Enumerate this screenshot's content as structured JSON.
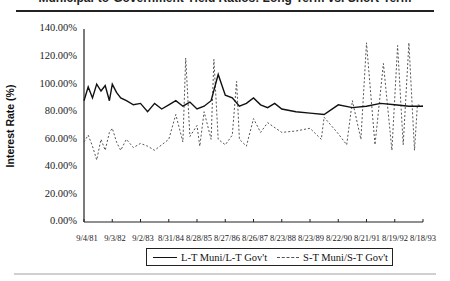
{
  "header": {
    "title_partial": "Municipal-to-Government Yield Ratios: Long-Term vs. Short-Term"
  },
  "chart_data": {
    "type": "line",
    "title": "",
    "xlabel": "",
    "ylabel": "Interest Rate (%)",
    "ylim": [
      0,
      140
    ],
    "yticks": [
      "0.00%",
      "20.00%",
      "40.00%",
      "60.00%",
      "80.00%",
      "100.00%",
      "120.00%",
      "140.00%"
    ],
    "xticks": [
      "9/4/81",
      "9/3/82",
      "9/2/83",
      "8/31/84",
      "8/28/85",
      "8/27/86",
      "8/26/87",
      "8/23/88",
      "8/23/89",
      "8/22/90",
      "8/21/91",
      "8/19/92",
      "8/18/93"
    ],
    "grid": false,
    "legend_position": "bottom",
    "series": [
      {
        "name": "L-T Muni/L-T Gov't",
        "style": "solid",
        "color": "#111111",
        "x": [
          0,
          0.15,
          0.3,
          0.45,
          0.6,
          0.75,
          0.9,
          1.0,
          1.15,
          1.3,
          1.5,
          1.75,
          2.0,
          2.25,
          2.5,
          2.75,
          3.0,
          3.25,
          3.5,
          3.75,
          4.0,
          4.25,
          4.5,
          4.75,
          5.0,
          5.25,
          5.5,
          5.75,
          6.0,
          6.25,
          6.5,
          6.75,
          7.0,
          7.5,
          8.0,
          8.5,
          9.0,
          9.5,
          10.0,
          10.5,
          11.0,
          11.5,
          12.0
        ],
        "values": [
          88,
          98,
          90,
          100,
          95,
          99,
          88,
          100,
          94,
          90,
          88,
          85,
          86,
          80,
          86,
          82,
          85,
          88,
          84,
          87,
          82,
          84,
          88,
          107,
          92,
          90,
          84,
          86,
          90,
          85,
          83,
          86,
          82,
          80,
          79,
          78,
          85,
          83,
          84,
          86,
          85,
          84,
          84
        ]
      },
      {
        "name": "S-T Muni/S-T Gov't",
        "style": "dashed",
        "color": "#555555",
        "x": [
          0,
          0.15,
          0.3,
          0.45,
          0.6,
          0.75,
          0.9,
          1.0,
          1.15,
          1.3,
          1.5,
          1.75,
          2.0,
          2.25,
          2.5,
          2.75,
          3.0,
          3.25,
          3.5,
          3.6,
          3.75,
          4.0,
          4.1,
          4.25,
          4.5,
          4.6,
          4.75,
          5.0,
          5.25,
          5.4,
          5.5,
          5.75,
          6.0,
          6.25,
          6.5,
          7.0,
          7.5,
          8.0,
          8.4,
          8.5,
          9.0,
          9.3,
          9.5,
          9.8,
          10.0,
          10.3,
          10.6,
          10.9,
          11.1,
          11.3,
          11.5,
          11.7,
          11.8,
          12.0
        ],
        "values": [
          58,
          63,
          55,
          45,
          60,
          52,
          65,
          68,
          58,
          52,
          60,
          54,
          57,
          55,
          52,
          56,
          60,
          78,
          58,
          119,
          62,
          70,
          55,
          80,
          60,
          118,
          60,
          56,
          63,
          102,
          60,
          55,
          75,
          65,
          72,
          65,
          66,
          68,
          60,
          76,
          64,
          56,
          88,
          60,
          130,
          56,
          115,
          52,
          128,
          56,
          130,
          52,
          85,
          84
        ]
      }
    ]
  },
  "legend": {
    "items": [
      {
        "label": "L-T Muni/L-T Gov't",
        "style": "solid"
      },
      {
        "label": "S-T Muni/S-T Gov't",
        "style": "dashed"
      }
    ]
  }
}
